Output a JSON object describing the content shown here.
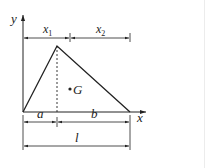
{
  "figure": {
    "axes": {
      "x_label": "x",
      "y_label": "y"
    },
    "triangle": {
      "apex_split_label": "dashed altitude"
    },
    "centroid": {
      "label": "G"
    },
    "dimensions": {
      "top_left": {
        "label": "x",
        "subscript": "1"
      },
      "top_right": {
        "label": "x",
        "subscript": "2"
      },
      "base_left": {
        "label": "a"
      },
      "base_right": {
        "label": "b"
      },
      "base_total": {
        "label": "l"
      }
    },
    "colors": {
      "ink": "#222222",
      "background": "#ffffff"
    }
  }
}
